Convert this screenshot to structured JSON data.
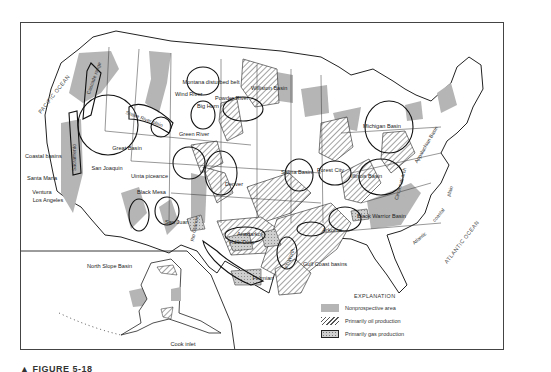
{
  "figure": {
    "caption": "▲ FIGURE 5-18",
    "colors": {
      "nonprospective": "#b5b5b5",
      "oil_hatch": "#555555",
      "gas_fill": "#cfcfcf",
      "outline": "#222222",
      "border": "#444444"
    }
  },
  "oceans": {
    "pacific": "PACIFIC OCEAN",
    "atlantic": "ATLANTIC OCEAN"
  },
  "basins": {
    "cascade_range": "Cascade range",
    "snake_river_plain": "Snake River plain",
    "montana_disturbed_belt": "Montana disturbed belt",
    "wind_river": "Wind River",
    "big_horn": "Big Horn",
    "powder_river": "Powder River",
    "williston_basin": "Williston Basin",
    "sacramento": "Sacramento",
    "great_basin": "Great Basin",
    "green_river": "Green River",
    "coastal_basins": "Coastal basins",
    "san_joaquin": "San Joaquin",
    "santa_maria": "Santa Maria",
    "ventura": "Ventura",
    "los_angeles": "Los Angeles",
    "uinta_piceance": "Uinta piceance",
    "black_mesa": "Black Mesa",
    "san_juan": "San Juan",
    "rio_grande": "Rio Grande",
    "denver": "Denver",
    "salina_basin": "Salina Basin",
    "forest_city": "Forest City",
    "anadarko": "Anadarko",
    "palo_duro": "Palo Duro",
    "permian": "Permian",
    "ft_worth": "Ft. Worth",
    "arkoma": "Arkoma",
    "michigan_basin": "Michigan Basin",
    "illinois_basin": "Illinois Basin",
    "cincinnati_arch": "Cincinnati arch",
    "appalachian_basin": "Appalachian Basin",
    "black_warrior_basin": "Black Warrior Basin",
    "gulf_coast_basins": "Gulf Coast basins",
    "atlantic_coastal_plain_1": "Atlantic",
    "atlantic_coastal_plain_2": "coastal",
    "atlantic_coastal_plain_3": "plain",
    "north_slope_basin": "North Slope Basin",
    "cook_inlet": "Cook inlet"
  },
  "legend": {
    "title": "EXPLANATION",
    "items": [
      {
        "label": "Nonprospective area",
        "type": "nonprospective"
      },
      {
        "label": "Primarily oil production",
        "type": "oil"
      },
      {
        "label": "Primarily gas production",
        "type": "gas"
      }
    ]
  }
}
